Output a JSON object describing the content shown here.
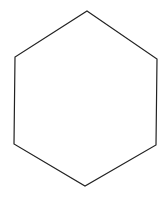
{
  "diagram": {
    "shape": "hexagon",
    "stroke_color": "#222222",
    "fill_color": "#ffffff",
    "stroke_width": 1.2,
    "vertices": [
      [
        87,
        11
      ],
      [
        157,
        59
      ],
      [
        156,
        145
      ],
      [
        85,
        186
      ],
      [
        14,
        144
      ],
      [
        15,
        57
      ]
    ]
  }
}
